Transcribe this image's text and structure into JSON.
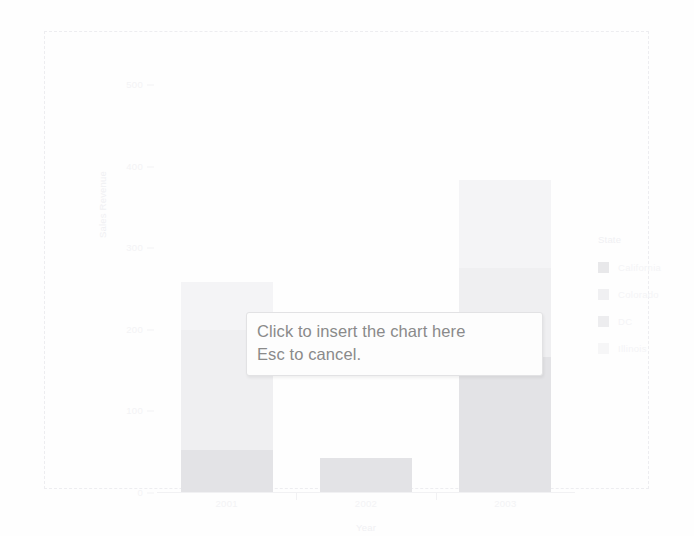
{
  "app": {
    "mode_hint_line1": "Click to insert the chart here",
    "mode_hint_line2": "Esc to cancel."
  },
  "legend": {
    "title": "State",
    "items": [
      {
        "label": "California",
        "color": "#e8e8ea"
      },
      {
        "label": "Colorado",
        "color": "#f0f0f2"
      },
      {
        "label": "DC",
        "color": "#ededef"
      },
      {
        "label": "Illinois",
        "color": "#f6f6f7"
      }
    ]
  },
  "chart_data": {
    "type": "bar",
    "stacked": true,
    "title": "",
    "xlabel": "Year",
    "ylabel": "Sales Revenue",
    "categories": [
      "2001",
      "2002",
      "2003"
    ],
    "ylim": [
      0,
      500
    ],
    "yticks": [
      0,
      100,
      200,
      300,
      400,
      500
    ],
    "ytick_labels": [
      "0",
      "100",
      "200",
      "300",
      "400",
      "500"
    ],
    "grid": false,
    "legend_position": "right",
    "legend_title": "State",
    "series": [
      {
        "name": "California",
        "color": "#e3e3e6",
        "values": [
          52,
          42,
          165
        ]
      },
      {
        "name": "Colorado",
        "color": "#efeff1",
        "values": [
          147,
          0,
          110
        ]
      },
      {
        "name": "DC",
        "color": "#ebebed",
        "values": [
          0,
          0,
          0
        ]
      },
      {
        "name": "Illinois",
        "color": "#f4f4f6",
        "values": [
          58,
          0,
          107
        ]
      }
    ],
    "totals": [
      257,
      42,
      382
    ]
  }
}
